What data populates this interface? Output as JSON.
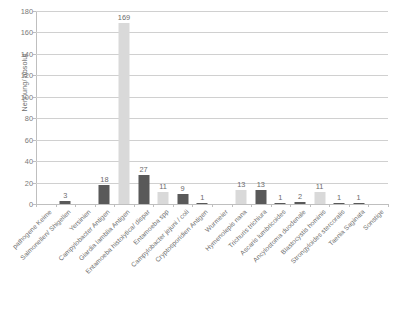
{
  "chart_data": {
    "type": "bar",
    "title": "",
    "xlabel": "",
    "ylabel": "Nennung/ absolut",
    "ylim": [
      0,
      180
    ],
    "ytick_step": 20,
    "grid": true,
    "legend": "none",
    "yticks": [
      "0",
      "20",
      "40",
      "60",
      "80",
      "100",
      "120",
      "140",
      "160",
      "180"
    ],
    "categories": [
      "pathogene Keime",
      "Salmonellen/ Shigellen",
      "Yersinien",
      "Campylobacter Antigen",
      "Giardia lamblia Antigen",
      "Entamoeba histolytica/ dispar",
      "Entamoeba spp",
      "Campylobacter jejuni / coli",
      "Cryptosporidien Antigen",
      "Wurmeier",
      "Hymenolepis nana",
      "Trichuris trichiura",
      "Ascaris lumbricoides",
      "Ancylostoma duodenale",
      "Blastocystis hominis",
      "Strongyloides stercoralis",
      "Taenia Saginata",
      "Sonstige"
    ],
    "values": [
      0,
      3,
      0,
      18,
      169,
      27,
      11,
      9,
      1,
      0,
      13,
      13,
      1,
      2,
      11,
      1,
      1,
      0
    ],
    "value_labels": [
      "",
      "3",
      "",
      "18",
      "169",
      "27",
      "11",
      "9",
      "1",
      "",
      "13",
      "13",
      "1",
      "2",
      "11",
      "1",
      "1",
      ""
    ],
    "bar_colors": [
      "none",
      "#595959",
      "none",
      "#595959",
      "#d9d9d9",
      "#595959",
      "#d9d9d9",
      "#595959",
      "#595959",
      "none",
      "#d9d9d9",
      "#595959",
      "#595959",
      "#595959",
      "#d9d9d9",
      "#595959",
      "#595959",
      "none"
    ],
    "colors": {
      "dark_bar": "#595959",
      "light_bar": "#d9d9d9",
      "gridline": "#d0d0d0",
      "axis": "#bfbfbf",
      "text": "#6b6b6b",
      "background": "#ffffff"
    }
  }
}
